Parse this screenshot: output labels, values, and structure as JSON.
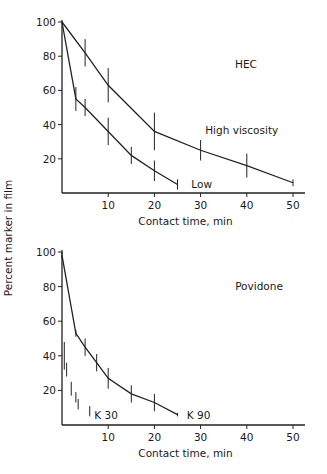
{
  "figure": {
    "ylabel": "Percent marker in film"
  },
  "chart_data": [
    {
      "type": "line",
      "panel": "top",
      "title": "HEC",
      "xlabel": "Contact time, min",
      "ylabel": "Percent marker in film",
      "xlim": [
        0,
        52
      ],
      "ylim": [
        0,
        100
      ],
      "xticks": [
        10,
        20,
        30,
        40,
        50
      ],
      "yticks": [
        20,
        40,
        60,
        80,
        100
      ],
      "grid": false,
      "series": [
        {
          "name": "High viscosity",
          "x": [
            0,
            5,
            10,
            20,
            30,
            40,
            50
          ],
          "y": [
            100,
            82,
            63,
            36,
            25,
            16,
            6
          ],
          "err": [
            0,
            8,
            10,
            11,
            6,
            7,
            2
          ],
          "label_pos": {
            "x": 31,
            "y": 37
          }
        },
        {
          "name": "Low",
          "x": [
            0,
            3,
            5,
            10,
            15,
            20,
            25
          ],
          "y": [
            100,
            55,
            50,
            36,
            22,
            13,
            5
          ],
          "err": [
            0,
            7,
            5,
            8,
            5,
            6,
            3
          ],
          "label_pos": {
            "x": 28,
            "y": 5
          }
        }
      ]
    },
    {
      "type": "line",
      "panel": "bottom",
      "title": "Povidone",
      "xlabel": "Contact time, min",
      "ylabel": "Percent marker in film",
      "xlim": [
        0,
        52
      ],
      "ylim": [
        0,
        100
      ],
      "xticks": [
        10,
        20,
        30,
        40,
        50
      ],
      "yticks": [
        20,
        40,
        60,
        80,
        100
      ],
      "grid": false,
      "series": [
        {
          "name": "K 90",
          "x": [
            0,
            3,
            5,
            7.5,
            10,
            15,
            20,
            25
          ],
          "y": [
            98,
            53,
            45,
            36,
            27,
            18,
            13,
            6
          ],
          "err": [
            2,
            2,
            5,
            5,
            6,
            5,
            5,
            1
          ],
          "label_pos": {
            "x": 27,
            "y": 6
          },
          "line": true
        },
        {
          "name": "K 30",
          "x": [
            0.5,
            1,
            2,
            3,
            3.5,
            6
          ],
          "y": [
            40,
            32,
            21,
            16,
            12,
            8
          ],
          "err": [
            8,
            4,
            4,
            3,
            3,
            3
          ],
          "label_pos": {
            "x": 7,
            "y": 6
          },
          "line": false
        }
      ]
    }
  ]
}
